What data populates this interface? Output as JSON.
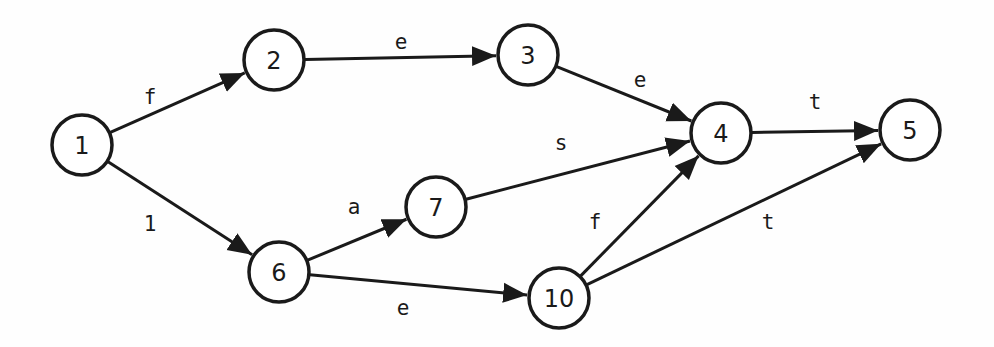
{
  "diagram": {
    "type": "directed-graph",
    "node_radius": 30,
    "colors": {
      "stroke": "#1a1a1a",
      "fill": "#ffffff",
      "background": "#fefefe"
    },
    "nodes": [
      {
        "id": "1",
        "label": "1",
        "x": 82,
        "y": 145
      },
      {
        "id": "2",
        "label": "2",
        "x": 274,
        "y": 60
      },
      {
        "id": "3",
        "label": "3",
        "x": 528,
        "y": 55
      },
      {
        "id": "4",
        "label": "4",
        "x": 721,
        "y": 133
      },
      {
        "id": "5",
        "label": "5",
        "x": 910,
        "y": 130
      },
      {
        "id": "6",
        "label": "6",
        "x": 279,
        "y": 272
      },
      {
        "id": "7",
        "label": "7",
        "x": 436,
        "y": 207
      },
      {
        "id": "10",
        "label": "10",
        "x": 559,
        "y": 298
      }
    ],
    "edges": [
      {
        "from": "1",
        "to": "2",
        "label": "f",
        "lx": 150,
        "ly": 97
      },
      {
        "from": "1",
        "to": "6",
        "label": "1",
        "lx": 150,
        "ly": 224
      },
      {
        "from": "2",
        "to": "3",
        "label": "e",
        "lx": 401,
        "ly": 42
      },
      {
        "from": "3",
        "to": "4",
        "label": "e",
        "lx": 640,
        "ly": 80
      },
      {
        "from": "7",
        "to": "4",
        "label": "s",
        "lx": 561,
        "ly": 143
      },
      {
        "from": "6",
        "to": "7",
        "label": "a",
        "lx": 354,
        "ly": 207
      },
      {
        "from": "6",
        "to": "10",
        "label": "e",
        "lx": 403,
        "ly": 308
      },
      {
        "from": "10",
        "to": "4",
        "label": "f",
        "lx": 595,
        "ly": 222
      },
      {
        "from": "10",
        "to": "5",
        "label": "t",
        "lx": 768,
        "ly": 222
      },
      {
        "from": "4",
        "to": "5",
        "label": "t",
        "lx": 815,
        "ly": 102
      }
    ]
  }
}
